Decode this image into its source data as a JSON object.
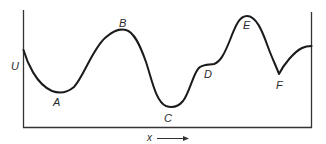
{
  "diagram": {
    "type": "potential-energy-curve",
    "y_axis_label": "U",
    "x_axis_label": "x",
    "x_axis_arrow": "right-arrow",
    "points": [
      {
        "label": "A",
        "kind": "local-minimum"
      },
      {
        "label": "B",
        "kind": "local-maximum"
      },
      {
        "label": "C",
        "kind": "global-minimum"
      },
      {
        "label": "D",
        "kind": "inflection-shoulder"
      },
      {
        "label": "E",
        "kind": "global-maximum"
      },
      {
        "label": "F",
        "kind": "cusp-minimum"
      }
    ],
    "colors": {
      "curve": "#1a1a1a",
      "axis": "#333333",
      "background": "#ffffff"
    }
  }
}
